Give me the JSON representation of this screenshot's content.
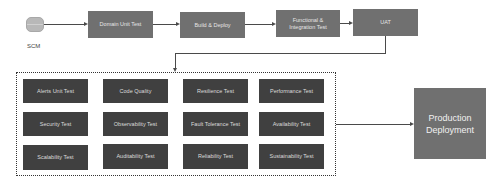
{
  "source": {
    "label": "SCM",
    "icon": "database-icon"
  },
  "pipeline": [
    {
      "label": "Domain Unit Test"
    },
    {
      "label": "Build & Deploy"
    },
    {
      "label": "Functional & Integration Test"
    },
    {
      "label": "UAT"
    }
  ],
  "test_grid": [
    [
      "Alerts Unit Test",
      "Code Quality",
      "Resilience Test",
      "Performance Test"
    ],
    [
      "Security Test",
      "Observability Test",
      "Fault Tolerance Test",
      "Availability Test"
    ],
    [
      "Scalability Test",
      "Auditability Test",
      "Reliability Test",
      "Sustainability Test"
    ]
  ],
  "target": {
    "label": "Production Deployment"
  },
  "colors": {
    "pipeline_box": "#707070",
    "test_box": "#404040",
    "connector": "#4a4a4a"
  }
}
